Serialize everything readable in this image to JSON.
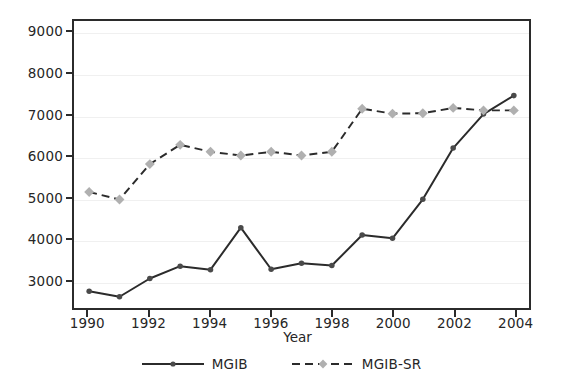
{
  "chart_data": {
    "type": "line",
    "title": "",
    "xlabel": "Year",
    "ylabel": "",
    "x": [
      1990,
      1991,
      1992,
      1993,
      1994,
      1995,
      1996,
      1997,
      1998,
      1999,
      2000,
      2001,
      2002,
      2003,
      2004
    ],
    "xlim": [
      1989.5,
      2004.5
    ],
    "ylim": [
      2300,
      9300
    ],
    "xticks": [
      1990,
      1992,
      1994,
      1996,
      1998,
      2000,
      2002,
      2004
    ],
    "xtick_labels": [
      "1990",
      "1992",
      "1994",
      "1996",
      "1998",
      "2000",
      "2002",
      "2004"
    ],
    "yticks": [
      3000,
      4000,
      5000,
      6000,
      7000,
      8000,
      9000
    ],
    "ytick_labels": [
      "3000",
      "4000",
      "5000",
      "6000",
      "7000",
      "8000",
      "9000"
    ],
    "grid": true,
    "grid_axis": "y",
    "legend_position": "bottom-center",
    "series": [
      {
        "name": "MGIB",
        "line_style": "solid",
        "marker": "circle",
        "line_color": "#2b2b2b",
        "marker_color": "#4a4a4a",
        "values": [
          2710,
          2575,
          3020,
          3320,
          3235,
          4260,
          3245,
          3390,
          3335,
          4080,
          4000,
          4950,
          6200,
          7030,
          7480
        ]
      },
      {
        "name": "MGIB-SR",
        "line_style": "dashed",
        "marker": "diamond",
        "line_color": "#2b2b2b",
        "marker_color": "#b0b0b0",
        "values": [
          5130,
          4945,
          5810,
          6280,
          6110,
          6020,
          6110,
          6020,
          6110,
          7160,
          7040,
          7050,
          7180,
          7120,
          7120
        ]
      }
    ]
  },
  "legend": {
    "entries": [
      {
        "label": "MGIB"
      },
      {
        "label": "MGIB-SR"
      }
    ]
  },
  "axis": {
    "x_title": "Year"
  },
  "colors": {
    "frame": "#2b2b2b",
    "grid": "#f0f0f0",
    "background": "#ffffff",
    "series_mgib": "#2b2b2b",
    "series_mgib_sr_marker": "#b0b0b0"
  }
}
